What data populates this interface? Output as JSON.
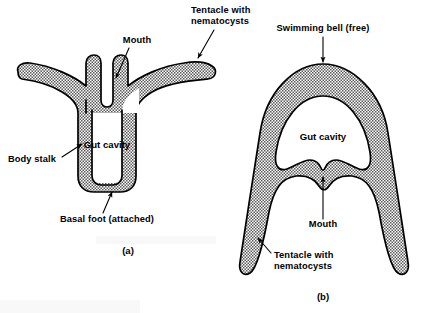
{
  "figure": {
    "background_color": "#ffffff",
    "ink_color": "#000000",
    "wall_fill_description": "fine stipple / dotted texture",
    "panels": [
      {
        "id": "a",
        "caption": "(a)",
        "form_name": "polyp",
        "labels": [
          {
            "key": "mouth",
            "text": "Mouth"
          },
          {
            "key": "tentacle",
            "text_line1": "Tentacle with",
            "text_line2": "nematocysts"
          },
          {
            "key": "gut_cavity",
            "text": "Gut cavity"
          },
          {
            "key": "body_stalk",
            "text": "Body stalk"
          },
          {
            "key": "basal_foot",
            "text": "Basal foot (attached)"
          }
        ]
      },
      {
        "id": "b",
        "caption": "(b)",
        "form_name": "medusa",
        "labels": [
          {
            "key": "swimming_bell",
            "text": "Swimming bell (free)"
          },
          {
            "key": "gut_cavity",
            "text": "Gut cavity"
          },
          {
            "key": "mouth",
            "text": "Mouth"
          },
          {
            "key": "tentacle",
            "text_line1": "Tentacle with",
            "text_line2": "nematocysts"
          }
        ]
      }
    ]
  }
}
